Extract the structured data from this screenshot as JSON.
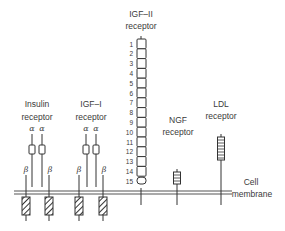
{
  "figure": {
    "membrane_label": [
      "Cell",
      "membrane"
    ],
    "receptors": [
      {
        "name": "insulin",
        "label": [
          "Insulin",
          "receptor"
        ],
        "subunits": {
          "alpha": "α",
          "beta": "β"
        },
        "alpha_count": 2,
        "beta_count": 2
      },
      {
        "name": "igf1",
        "label": [
          "IGF–I",
          "receptor"
        ],
        "subunits": {
          "alpha": "α",
          "beta": "β"
        },
        "alpha_count": 2,
        "beta_count": 2
      },
      {
        "name": "igf2",
        "label": [
          "IGF–II",
          "receptor"
        ],
        "domain_numbers": [
          "1",
          "2",
          "3",
          "4",
          "5",
          "6",
          "7",
          "8",
          "9",
          "10",
          "11",
          "12",
          "13",
          "14",
          "15"
        ]
      },
      {
        "name": "ngf",
        "label": [
          "NGF",
          "receptor"
        ]
      },
      {
        "name": "ldl",
        "label": [
          "LDL",
          "receptor"
        ]
      }
    ]
  },
  "colors": {
    "ink": "#3a3a3a",
    "membrane": "#555555",
    "background": "#ffffff"
  }
}
